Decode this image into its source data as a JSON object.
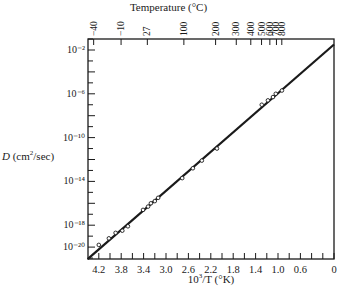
{
  "chart_data": {
    "type": "scatter",
    "title": "",
    "xlabel": "10^3/T (°K)",
    "ylabel": "D (cm²/sec)",
    "top_axis_label": "Temperature (°C)",
    "x_axis_reversed": true,
    "xlim": [
      4.4,
      0
    ],
    "ylim_log10": [
      -21.1,
      -1.3
    ],
    "x_ticks": [
      4.2,
      3.8,
      3.4,
      3.0,
      2.6,
      2.2,
      1.8,
      1.4,
      1.0,
      0.6,
      0
    ],
    "x_tick_labels": [
      "4.2",
      "3.8",
      "3.4",
      "3.0",
      "2.6",
      "2.2",
      "1.8",
      "1.4",
      "1.0",
      "0.6",
      "0"
    ],
    "y_ticks_log10": [
      -2,
      -6,
      -10,
      -14,
      -18,
      -20
    ],
    "y_tick_labels": [
      "10⁻²",
      "10⁻⁶",
      "10⁻¹⁰",
      "10⁻¹⁴",
      "10⁻¹⁸",
      "10⁻²⁰"
    ],
    "top_ticks_celsius": [
      -40,
      -10,
      27,
      100,
      200,
      300,
      400,
      500,
      600,
      800,
      700
    ],
    "top_tick_labels": [
      "−40",
      "−10",
      "27",
      "100",
      "200",
      "300",
      "400",
      "500",
      "600",
      "800",
      "700"
    ],
    "grid": false,
    "legend": null,
    "fit_line": {
      "x": [
        4.4,
        0
      ],
      "log10_y": [
        -21.1,
        -1.5
      ]
    },
    "series": [
      {
        "name": "measured D",
        "marker": "open-circle",
        "x": [
          4.2,
          4.02,
          3.9,
          3.78,
          3.68,
          3.41,
          3.32,
          3.27,
          3.2,
          3.14,
          2.71,
          2.52,
          2.36,
          2.09,
          1.29,
          1.18,
          1.09,
          1.04,
          0.93
        ],
        "log10_y": [
          -19.8,
          -19.2,
          -18.7,
          -18.5,
          -18.1,
          -16.6,
          -16.3,
          -16.0,
          -15.8,
          -15.5,
          -13.7,
          -12.8,
          -12.1,
          -11.0,
          -7.0,
          -6.6,
          -6.3,
          -6.0,
          -5.7
        ]
      }
    ]
  },
  "labels": {
    "top_title": "Temperature (°C)",
    "x_title_prefix": "10",
    "x_title_exp": "3",
    "x_title_suffix": "/T (°K)",
    "y_title_D": "D",
    "y_title_rest": " (cm",
    "y_title_exp": "2",
    "y_title_end": "/sec)"
  }
}
